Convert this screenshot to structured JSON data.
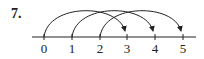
{
  "problem": {
    "number": "7."
  },
  "number_line": {
    "labels": [
      "0",
      "1",
      "2",
      "3",
      "4",
      "5"
    ],
    "arcs": [
      {
        "from": "0",
        "to": "3"
      },
      {
        "from": "1",
        "to": "4"
      },
      {
        "from": "2",
        "to": "5"
      }
    ],
    "line_color": "#222222"
  }
}
